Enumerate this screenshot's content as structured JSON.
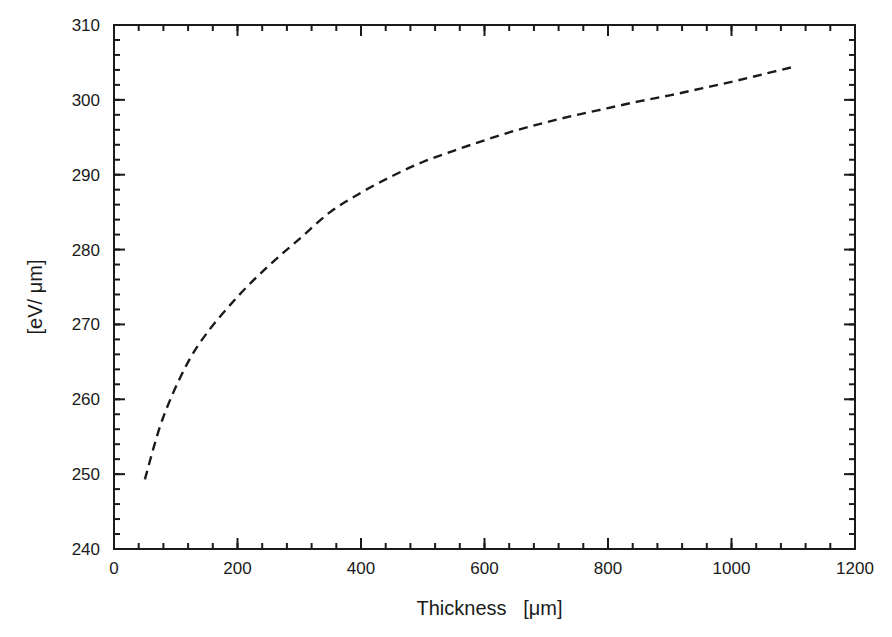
{
  "chart_data": {
    "type": "line",
    "title": "",
    "xlabel": "Thickness   [μm]",
    "ylabel": "[eV/ μm]",
    "xlim": [
      0,
      1200
    ],
    "ylim": [
      240,
      310
    ],
    "x_ticks": [
      0,
      200,
      400,
      600,
      800,
      1000,
      1200
    ],
    "y_ticks": [
      240,
      250,
      260,
      270,
      280,
      290,
      300,
      310
    ],
    "x_minor_step": 40,
    "y_minor_step": 2,
    "grid": false,
    "legend": null,
    "series": [
      {
        "name": "energy deposition per thickness",
        "style": "dashed",
        "color": "#1a1a1a",
        "x": [
          50,
          78,
          115,
          150,
          200,
          250,
          300,
          350,
          400,
          450,
          500,
          550,
          600,
          650,
          700,
          750,
          800,
          850,
          900,
          950,
          1000,
          1050,
          1100
        ],
        "y": [
          249.3,
          257.2,
          264.2,
          268.8,
          273.7,
          277.8,
          281.4,
          285.0,
          287.6,
          289.8,
          291.7,
          293.2,
          294.6,
          295.9,
          297.0,
          298.0,
          298.9,
          299.8,
          300.6,
          301.5,
          302.4,
          303.4,
          304.4
        ]
      }
    ]
  },
  "layout": {
    "plot": {
      "left": 114,
      "top": 25,
      "right": 855,
      "bottom": 549
    }
  }
}
